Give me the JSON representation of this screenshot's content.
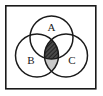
{
  "figure": {
    "name": "venn-diagram",
    "type": "three-set-venn",
    "background_color": "#ffffff",
    "stroke_color": "#1a1a1a",
    "frame": {
      "name": "universal-set-frame",
      "x": 5,
      "y": 5,
      "width": 91,
      "height": 84,
      "stroke_width": 1.6
    },
    "circles": [
      {
        "label": "A",
        "cx": 51.5,
        "cy": 37.5,
        "r": 21.5,
        "label_x": 51.5,
        "label_y": 28.5
      },
      {
        "label": "B",
        "cx": 37.0,
        "cy": 55.5,
        "r": 21.5,
        "label_x": 31.0,
        "label_y": 61.5
      },
      {
        "label": "C",
        "cx": 66.0,
        "cy": 55.5,
        "r": 21.5,
        "label_x": 72.0,
        "label_y": 61.5
      }
    ],
    "shaded_regions": [
      {
        "name": "triple-intersection-abc",
        "expression": "A ∩ B ∩ C",
        "fill": "#3a3a3a",
        "pattern": "cross-hatch"
      },
      {
        "name": "intersection-bc-only",
        "expression": "(B ∩ C) ∖ A",
        "fill": "#c9c9c9",
        "pattern": "light-solid"
      }
    ],
    "labels": {
      "a": "A",
      "b": "B",
      "c": "C"
    }
  }
}
